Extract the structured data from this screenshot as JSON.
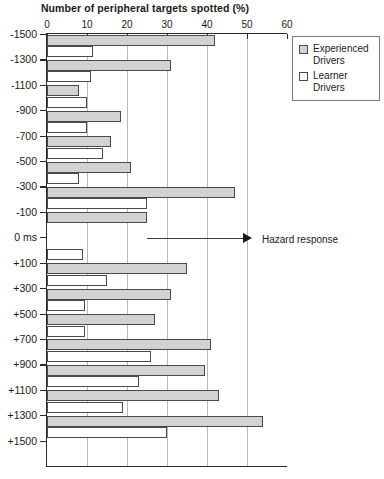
{
  "chart_data": {
    "type": "bar",
    "orientation": "horizontal",
    "title": "Number of peripheral targets spotted (%)",
    "xlabel": "Number of peripheral targets spotted (%)",
    "ylabel": "",
    "xlim": [
      0,
      60
    ],
    "xticks": [
      0,
      10,
      20,
      30,
      40,
      50,
      60
    ],
    "xtick_labels": [
      "0",
      "10",
      "20",
      "30",
      "40",
      "50",
      "60"
    ],
    "grid": "vertical",
    "legend_position": "top-right",
    "categories": [
      "-1500",
      "-1300",
      "-1100",
      "-900",
      "-700",
      "-500",
      "-300",
      "-100",
      "0 ms",
      "+100",
      "+300",
      "+500",
      "+700",
      "+900",
      "+1100",
      "+1300",
      "+1500"
    ],
    "series": [
      {
        "name": "Experienced Drivers",
        "color": "#d2d2d2",
        "values": [
          42,
          31,
          8,
          18.5,
          16,
          21,
          47,
          25,
          0,
          35,
          31,
          27,
          41,
          39.5,
          43,
          54,
          0
        ]
      },
      {
        "name": "Learner Drivers",
        "color": "#ffffff",
        "values": [
          11.5,
          11,
          10,
          10,
          14,
          8,
          25,
          0,
          9,
          15,
          9.5,
          9.5,
          26,
          23,
          19,
          30,
          0
        ]
      }
    ],
    "annotations": [
      {
        "text": "Hazard response",
        "at_category": "0 ms",
        "arrow": "right"
      }
    ]
  },
  "legend": {
    "items": [
      {
        "label_line1": "Experienced",
        "label_line2": "Drivers",
        "swatch": "filled-gray-square"
      },
      {
        "label_line1": "Learner",
        "label_line2": "Drivers",
        "swatch": "empty-white-square"
      }
    ]
  },
  "annotation": {
    "hazard_label": "Hazard response"
  },
  "colors": {
    "experienced_fill": "#d2d2d2",
    "learner_fill": "#ffffff",
    "bar_stroke": "#4a4a4a",
    "axis": "#2a2a2a",
    "grid": "#b9b9b9"
  }
}
